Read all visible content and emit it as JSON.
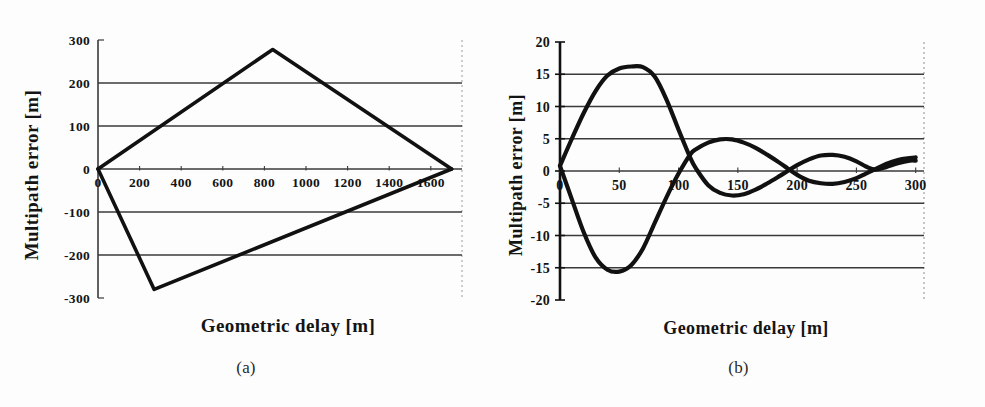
{
  "figure": {
    "background_color": "#fdfdfd",
    "ink_color": "#111111",
    "grid_color": "#3a3a3a",
    "panels": [
      {
        "id": "a",
        "caption": "(a)",
        "xlabel": "Geometric delay    [m]",
        "ylabel": "Multipath  error  [m]"
      },
      {
        "id": "b",
        "caption": "(b)",
        "xlabel": "Geometric   delay  [m]",
        "ylabel": "Multipath error [m]"
      }
    ]
  },
  "chart_data": [
    {
      "type": "line",
      "panel": "a",
      "title": "",
      "xlabel": "Geometric delay    [m]",
      "ylabel": "Multipath  error  [m]",
      "xlim": [
        0,
        1750
      ],
      "ylim": [
        -300,
        300
      ],
      "xticks": [
        0,
        200,
        400,
        600,
        800,
        1000,
        1200,
        1400,
        1600
      ],
      "xtick_labels": [
        "0",
        "200",
        "400",
        "600",
        "800",
        "1000",
        "1200",
        "1400",
        "1600"
      ],
      "yticks": [
        -300,
        -200,
        -100,
        0,
        100,
        200,
        300
      ],
      "ytick_labels": [
        "-300",
        "-200",
        "-100",
        "0",
        "100",
        "200",
        "300"
      ],
      "grid": true,
      "grid_axis": "y",
      "legend": "none",
      "series": [
        {
          "name": "upper-envelope",
          "x": [
            0,
            840,
            1700
          ],
          "values": [
            0,
            278,
            0
          ]
        },
        {
          "name": "lower-envelope",
          "x": [
            0,
            270,
            1700
          ],
          "values": [
            0,
            -280,
            0
          ]
        }
      ]
    },
    {
      "type": "line",
      "panel": "b",
      "title": "",
      "xlabel": "Geometric   delay  [m]",
      "ylabel": "Multipath error [m]",
      "xlim": [
        0,
        307
      ],
      "ylim": [
        -20,
        20
      ],
      "xticks": [
        0,
        50,
        100,
        150,
        200,
        250,
        300
      ],
      "xtick_labels": [
        "0",
        "50",
        "100",
        "150",
        "200",
        "250",
        "300"
      ],
      "yticks": [
        -20,
        -15,
        -10,
        -5,
        0,
        5,
        10,
        15,
        20
      ],
      "ytick_labels": [
        "-20",
        "-15",
        "-10",
        "-5",
        "0",
        "5",
        "10",
        "15",
        "20"
      ],
      "grid": true,
      "grid_axis": "y",
      "legend": "none",
      "series": [
        {
          "name": "damped-oscillation-positive",
          "x": [
            0,
            10,
            20,
            30,
            40,
            50,
            60,
            70,
            80,
            90,
            100,
            110,
            115,
            125,
            135,
            145,
            155,
            165,
            175,
            185,
            192,
            200,
            210,
            220,
            230,
            240,
            250,
            258,
            266,
            275,
            285,
            295,
            300
          ],
          "values": [
            0.8,
            5.0,
            9.0,
            12.4,
            14.8,
            15.9,
            16.2,
            16.1,
            14.6,
            11.0,
            6.4,
            2.0,
            0.3,
            -2.2,
            -3.4,
            -3.8,
            -3.6,
            -2.9,
            -1.9,
            -0.8,
            0.0,
            0.9,
            1.8,
            2.4,
            2.5,
            2.2,
            1.5,
            0.7,
            0.2,
            0.6,
            1.2,
            1.6,
            1.6
          ]
        },
        {
          "name": "damped-oscillation-negative",
          "x": [
            0,
            10,
            20,
            30,
            40,
            50,
            60,
            70,
            80,
            90,
            100,
            110,
            115,
            125,
            135,
            145,
            155,
            165,
            175,
            185,
            192,
            200,
            210,
            220,
            230,
            240,
            250,
            258,
            266,
            275,
            285,
            295,
            300
          ],
          "values": [
            0.8,
            -4.4,
            -9.5,
            -13.4,
            -15.3,
            -15.6,
            -14.6,
            -12.0,
            -8.0,
            -4.0,
            -0.4,
            2.6,
            3.4,
            4.4,
            4.9,
            4.9,
            4.4,
            3.6,
            2.5,
            1.3,
            0.4,
            -0.6,
            -1.5,
            -1.9,
            -2.0,
            -1.7,
            -1.1,
            -0.4,
            0.3,
            1.1,
            1.7,
            2.0,
            2.1
          ]
        }
      ]
    }
  ]
}
